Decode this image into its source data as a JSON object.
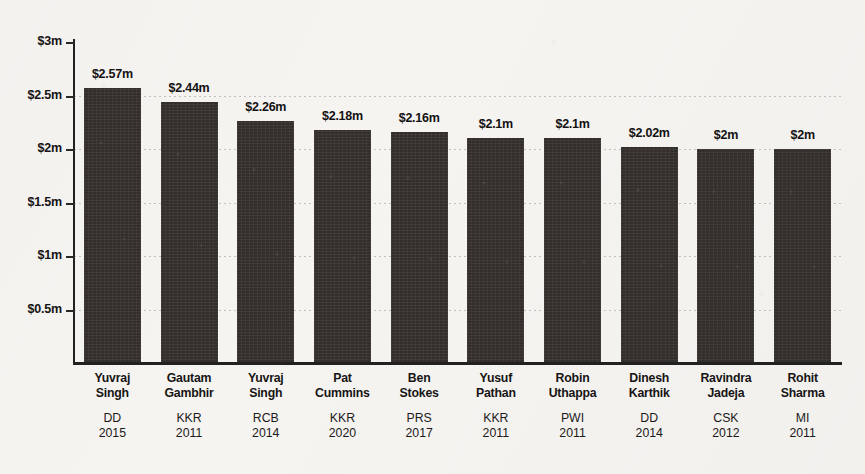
{
  "chart_data": {
    "type": "bar",
    "title": "",
    "subtitle": "",
    "xlabel": "",
    "ylabel": "",
    "ylim": [
      0,
      3
    ],
    "grid": true,
    "legend": "none",
    "orientation": "vertical",
    "bar_color": "#332e2b",
    "background_color": "#f6f4f1",
    "axis_color": "#232020",
    "currency_unit": "m",
    "y_ticks": [
      {
        "value": 0.5,
        "label": "$0.5m"
      },
      {
        "value": 1.0,
        "label": "$1m"
      },
      {
        "value": 1.5,
        "label": "$1.5m"
      },
      {
        "value": 2.0,
        "label": "$2m"
      },
      {
        "value": 2.5,
        "label": "$2.5m"
      },
      {
        "value": 3.0,
        "label": "$3m"
      }
    ],
    "categories": [
      "Yuvraj Singh",
      "Gautam Gambhir",
      "Yuvraj Singh",
      "Pat Cummins",
      "Ben Stokes",
      "Yusuf Pathan",
      "Robin Uthappa",
      "Dinesh Karthik",
      "Ravindra Jadeja",
      "Rohit Sharma"
    ],
    "values": [
      2.57,
      2.44,
      2.26,
      2.18,
      2.16,
      2.1,
      2.1,
      2.02,
      2.0,
      2.0
    ],
    "value_labels": [
      "$2.57m",
      "$2.44m",
      "$2.26m",
      "$2.18m",
      "$2.16m",
      "$2.1m",
      "$2.1m",
      "$2.02m",
      "$2m",
      "$2m"
    ],
    "bars": [
      {
        "name_line1": "Yuvraj",
        "name_line2": "Singh",
        "team": "DD",
        "year": "2015",
        "value": 2.57,
        "value_label": "$2.57m"
      },
      {
        "name_line1": "Gautam",
        "name_line2": "Gambhir",
        "team": "KKR",
        "year": "2011",
        "value": 2.44,
        "value_label": "$2.44m"
      },
      {
        "name_line1": "Yuvraj",
        "name_line2": "Singh",
        "team": "RCB",
        "year": "2014",
        "value": 2.26,
        "value_label": "$2.26m"
      },
      {
        "name_line1": "Pat",
        "name_line2": "Cummins",
        "team": "KKR",
        "year": "2020",
        "value": 2.18,
        "value_label": "$2.18m"
      },
      {
        "name_line1": "Ben",
        "name_line2": "Stokes",
        "team": "PRS",
        "year": "2017",
        "value": 2.16,
        "value_label": "$2.16m"
      },
      {
        "name_line1": "Yusuf",
        "name_line2": "Pathan",
        "team": "KKR",
        "year": "2011",
        "value": 2.1,
        "value_label": "$2.1m"
      },
      {
        "name_line1": "Robin",
        "name_line2": "Uthappa",
        "team": "PWI",
        "year": "2011",
        "value": 2.1,
        "value_label": "$2.1m"
      },
      {
        "name_line1": "Dinesh",
        "name_line2": "Karthik",
        "team": "DD",
        "year": "2014",
        "value": 2.02,
        "value_label": "$2.02m"
      },
      {
        "name_line1": "Ravindra",
        "name_line2": "Jadeja",
        "team": "CSK",
        "year": "2012",
        "value": 2.0,
        "value_label": "$2m"
      },
      {
        "name_line1": "Rohit",
        "name_line2": "Sharma",
        "team": "MI",
        "year": "2011",
        "value": 2.0,
        "value_label": "$2m"
      }
    ]
  }
}
